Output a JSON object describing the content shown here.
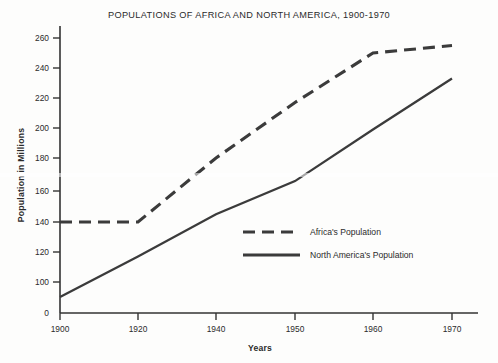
{
  "chart_data": {
    "type": "line",
    "title": "POPULATIONS OF AFRICA AND NORTH AMERICA, 1900-1970",
    "xlabel": "Years",
    "ylabel": "Population in Millions",
    "x": [
      1900,
      1920,
      1940,
      1950,
      1960,
      1970
    ],
    "xtick_labels": [
      "1900",
      "1920",
      "1940",
      "1950",
      "1960",
      "1970"
    ],
    "ytick_labels": [
      "0",
      "100",
      "120",
      "140",
      "160",
      "180",
      "200",
      "220",
      "240",
      "260"
    ],
    "yticks": [
      0,
      100,
      120,
      140,
      160,
      180,
      200,
      220,
      240,
      260
    ],
    "ylim": [
      0,
      270
    ],
    "y_axis_broken": true,
    "x_axis_nonlinear": true,
    "grid": false,
    "legend_position": "center-right-inside",
    "series": [
      {
        "name": "Africa's Population",
        "style": "dashed",
        "color": "#3b3b3b",
        "x": [
          1900,
          1920,
          1940,
          1950,
          1960,
          1970
        ],
        "values": [
          140,
          140,
          180,
          217,
          250,
          255
        ]
      },
      {
        "name": "North America's Population",
        "style": "solid",
        "color": "#3b3b3b",
        "x": [
          1900,
          1920,
          1940,
          1950,
          1960,
          1970
        ],
        "values": [
          90,
          117,
          145,
          166,
          199,
          233
        ]
      }
    ]
  },
  "legend": {
    "items": [
      {
        "label": "Africa's Population",
        "style": "dashed"
      },
      {
        "label": "North America's Population",
        "style": "solid"
      }
    ]
  },
  "axes": {
    "y_title": "Population in Millions",
    "x_title": "Years",
    "y_ticks": [
      {
        "label": "260",
        "y": 38
      },
      {
        "label": "240",
        "y": 68
      },
      {
        "label": "220",
        "y": 98
      },
      {
        "label": "200",
        "y": 128
      },
      {
        "label": "180",
        "y": 158
      },
      {
        "label": "160",
        "y": 191
      },
      {
        "label": "140",
        "y": 222
      },
      {
        "label": "120",
        "y": 252
      },
      {
        "label": "100",
        "y": 282
      },
      {
        "label": "0",
        "y": 313
      }
    ],
    "x_ticks": [
      {
        "label": "1900",
        "x": 60
      },
      {
        "label": "1920",
        "x": 138
      },
      {
        "label": "1940",
        "x": 216
      },
      {
        "label": "1950",
        "x": 295
      },
      {
        "label": "1960",
        "x": 373
      },
      {
        "label": "1970",
        "x": 452
      }
    ]
  }
}
